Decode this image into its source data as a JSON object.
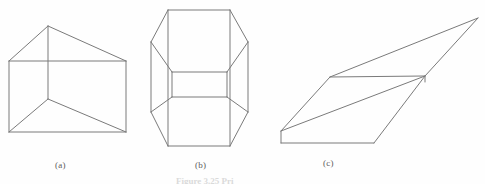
{
  "plate": {
    "background_color": "#fefefe",
    "stroke_color": "#7a7a7a",
    "label_color": "#5d5d5d",
    "caption_color": "#bdbdbd"
  },
  "panels": [
    {
      "id": "a",
      "label": "(a)",
      "shape_name": "triangular-prism-wireframe",
      "description": "Wireframe triangular prism seen end-on: a rectangle with an apex above and a vertical centre edge meeting two sloping floor edges."
    },
    {
      "id": "b",
      "label": "(b)",
      "shape_name": "octagonal-prism-wireframe",
      "description": "Wireframe octagonal prism viewed from the front with a visible inner rectangular band across the middle."
    },
    {
      "id": "c",
      "label": "(c)",
      "shape_name": "oblique-parallelogram-wireframe",
      "description": "Wireframe slab drawn as a strongly skewed parallelogram with a second parallelogram face beneath it."
    }
  ],
  "caption": {
    "text": "Figure 3.25  Pri"
  },
  "geometry": {
    "panel_a": {
      "edges": [
        [
          9,
          61,
          48,
          26
        ],
        [
          48,
          26,
          126,
          61
        ],
        [
          9,
          61,
          126,
          61
        ],
        [
          9,
          61,
          9,
          132
        ],
        [
          126,
          61,
          126,
          132
        ],
        [
          9,
          132,
          126,
          132
        ],
        [
          48,
          26,
          48,
          99
        ],
        [
          48,
          99,
          9,
          132
        ],
        [
          48,
          99,
          126,
          132
        ]
      ]
    },
    "panel_b": {
      "edges": [
        [
          168,
          10,
          230,
          10
        ],
        [
          168,
          10,
          151,
          42
        ],
        [
          230,
          10,
          248,
          42
        ],
        [
          151,
          42,
          151,
          112
        ],
        [
          248,
          42,
          248,
          112
        ],
        [
          151,
          112,
          168,
          146
        ],
        [
          248,
          112,
          230,
          146
        ],
        [
          168,
          146,
          230,
          146
        ],
        [
          168,
          10,
          168,
          146
        ],
        [
          230,
          10,
          230,
          146
        ],
        [
          151,
          42,
          172,
          72
        ],
        [
          248,
          42,
          227,
          72
        ],
        [
          151,
          112,
          172,
          97
        ],
        [
          248,
          112,
          227,
          97
        ],
        [
          172,
          72,
          227,
          72
        ],
        [
          172,
          97,
          227,
          97
        ],
        [
          172,
          72,
          172,
          97
        ],
        [
          227,
          72,
          227,
          97
        ]
      ]
    },
    "panel_c": {
      "edges": [
        [
          281,
          131,
          330,
          77
        ],
        [
          330,
          77,
          478,
          18
        ],
        [
          478,
          18,
          425,
          76
        ],
        [
          281,
          131,
          425,
          76
        ],
        [
          330,
          77,
          425,
          76
        ],
        [
          281,
          131,
          281,
          143
        ],
        [
          281,
          143,
          374,
          143
        ],
        [
          374,
          143,
          425,
          76
        ],
        [
          425,
          76,
          425,
          82
        ]
      ]
    }
  }
}
